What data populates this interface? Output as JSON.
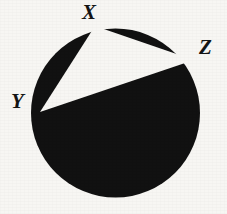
{
  "figure": {
    "kind": "geometry-diagram",
    "background_color": "#f7f6f3",
    "fill_color": "#111111",
    "triangle_fill_color": "#f7f6f3",
    "circle": {
      "center_x": 115.5,
      "center_y": 113,
      "radius": 84.5
    },
    "vertices": [
      {
        "id": "x",
        "label": "X",
        "x": 95,
        "y": 26,
        "label_x": 82,
        "label_y": 2,
        "font_size": 21
      },
      {
        "id": "z",
        "label": "Z",
        "x": 194,
        "y": 60,
        "label_x": 199,
        "label_y": 37,
        "font_size": 21
      },
      {
        "id": "y",
        "label": "Y",
        "x": 40,
        "y": 112,
        "label_x": 11,
        "label_y": 91,
        "font_size": 21
      }
    ],
    "triangle_points": "95,26 194,60 40,112"
  }
}
